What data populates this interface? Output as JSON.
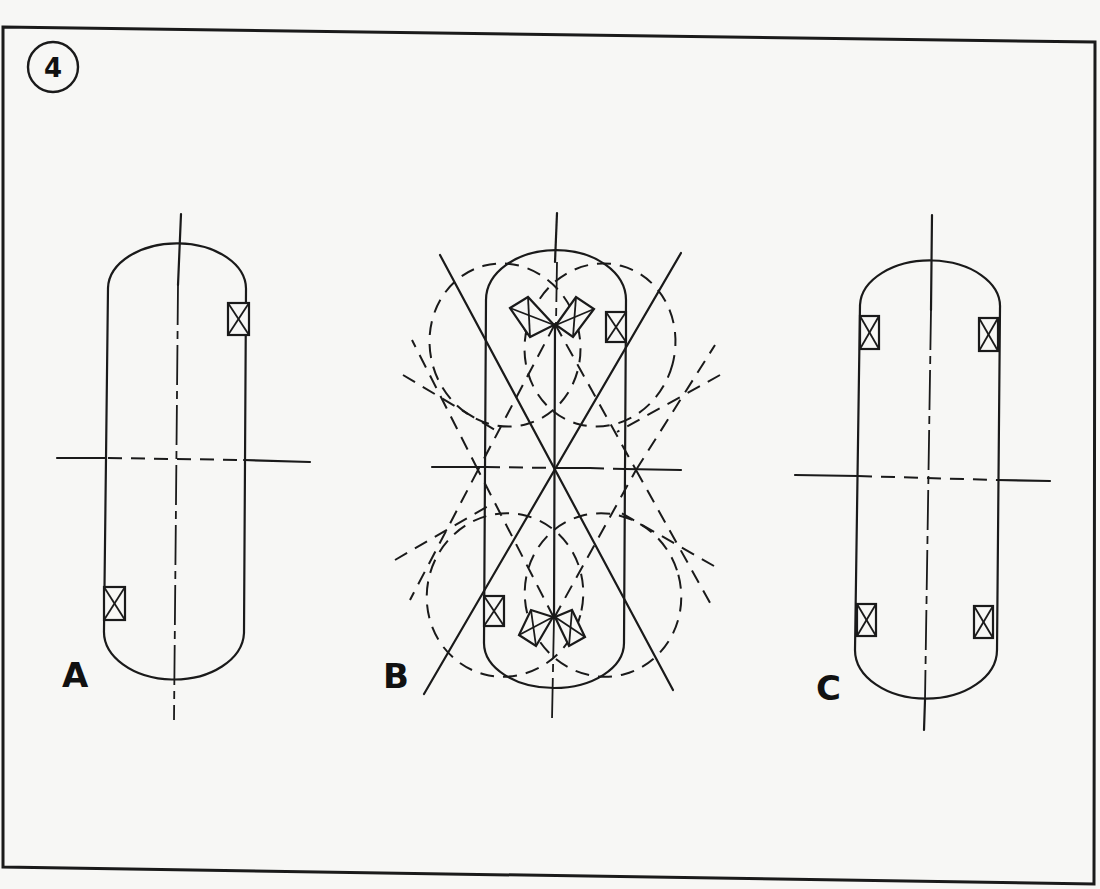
{
  "figure": {
    "number": "4",
    "panels": [
      {
        "id": "A",
        "label": "A",
        "description": "Single capsule with two diagonally opposite crossed-box markers (upper right, lower left), vertical center line and dashed horizontal center line"
      },
      {
        "id": "B",
        "label": "B",
        "description": "Capsule with two bow-tie reflector symbols on the vertical axis, two crossed-box markers, dashed lobe patterns and radiating construction lines"
      },
      {
        "id": "C",
        "label": "C",
        "description": "Capsule with four crossed-box markers near each corner, vertical center line and dashed horizontal center line"
      }
    ]
  },
  "colors": {
    "ink": "#1a1a1a",
    "paper": "#f7f7f5"
  }
}
